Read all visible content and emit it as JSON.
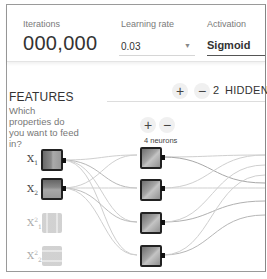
{
  "topbar": {
    "iterations": {
      "label": "Iterations",
      "value": "000,000"
    },
    "learning_rate": {
      "label": "Learning rate",
      "value": "0.03",
      "arrow": "▼"
    },
    "activation": {
      "label": "Activation",
      "value": "Sigmoid"
    }
  },
  "features": {
    "title": "FEATURES",
    "subtitle": "Which properties do you want to feed in?",
    "inputs": [
      {
        "name": "X",
        "sub": "1",
        "sup": "",
        "active": true
      },
      {
        "name": "X",
        "sub": "2",
        "sup": "",
        "active": true
      },
      {
        "name": "X",
        "sub": "1",
        "sup": "2",
        "active": false
      },
      {
        "name": "X",
        "sub": "2",
        "sup": "2",
        "active": false
      }
    ]
  },
  "hidden_layers": {
    "add_label": "+",
    "remove_label": "−",
    "count": "2",
    "label": "HIDDEN"
  },
  "layer1": {
    "add_label": "+",
    "remove_label": "−",
    "neurons_label": "4 neurons",
    "neuron_count": 4
  },
  "colors": {
    "link": "#c8c8c8",
    "link_dark": "#a8a8a8",
    "node_border": "#222222",
    "active_underline": "#555555"
  }
}
